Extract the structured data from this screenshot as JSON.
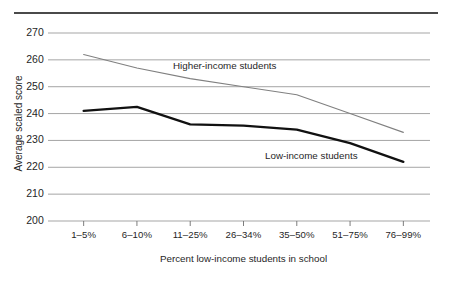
{
  "chart_data": {
    "type": "line",
    "title": "",
    "subtitle": "",
    "xlabel": "Percent low-income students in school",
    "ylabel": "Average scaled score",
    "categories": [
      "1–5%",
      "6–10%",
      "11–25%",
      "26–34%",
      "35–50%",
      "51–75%",
      "76–99%"
    ],
    "ylim": [
      200,
      270
    ],
    "yticks": [
      200,
      210,
      220,
      230,
      240,
      250,
      260,
      270
    ],
    "ytick_labels": [
      "200",
      "210",
      "220",
      "230",
      "240",
      "250",
      "260",
      "270"
    ],
    "grid": true,
    "legend": "inline-annotation",
    "series": [
      {
        "name": "Higher-income students",
        "color": "#808080",
        "line_width": 1.1,
        "values": [
          262,
          257,
          253,
          250,
          247,
          240,
          233
        ]
      },
      {
        "name": "Low-income students",
        "color": "#111111",
        "line_width": 2.3,
        "values": [
          241,
          242.5,
          236,
          235.5,
          234,
          229,
          222
        ]
      }
    ],
    "annotations": [
      {
        "text": "Higher-income students",
        "series": "Higher-income students"
      },
      {
        "text": "Low-income students",
        "series": "Low-income students"
      }
    ]
  },
  "style": {
    "background": "#ffffff",
    "grid_color": "#9b9b9b",
    "axis_color": "#6e6e6e",
    "top_rule_color": "#4a4a4a",
    "text_color": "#1f1f1f"
  }
}
